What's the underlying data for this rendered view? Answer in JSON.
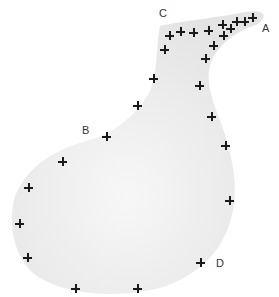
{
  "diagram": {
    "shape_fill": "#ededed",
    "labels": [
      {
        "id": "A",
        "text": "A",
        "x": 262,
        "y": 23
      },
      {
        "id": "B",
        "text": "B",
        "x": 82,
        "y": 125
      },
      {
        "id": "C",
        "text": "C",
        "x": 159,
        "y": 8
      },
      {
        "id": "D",
        "text": "D",
        "x": 216,
        "y": 258
      }
    ],
    "markers": [
      {
        "x": 169,
        "y": 35
      },
      {
        "x": 180,
        "y": 31
      },
      {
        "x": 193,
        "y": 32
      },
      {
        "x": 208,
        "y": 30
      },
      {
        "x": 222,
        "y": 24
      },
      {
        "x": 230,
        "y": 28
      },
      {
        "x": 236,
        "y": 21
      },
      {
        "x": 244,
        "y": 21
      },
      {
        "x": 252,
        "y": 17
      },
      {
        "x": 223,
        "y": 35
      },
      {
        "x": 213,
        "y": 45
      },
      {
        "x": 205,
        "y": 58
      },
      {
        "x": 164,
        "y": 49
      },
      {
        "x": 153,
        "y": 78
      },
      {
        "x": 199,
        "y": 85
      },
      {
        "x": 137,
        "y": 105
      },
      {
        "x": 106,
        "y": 136
      },
      {
        "x": 62,
        "y": 161
      },
      {
        "x": 28,
        "y": 187
      },
      {
        "x": 211,
        "y": 116
      },
      {
        "x": 225,
        "y": 145
      },
      {
        "x": 229,
        "y": 200
      },
      {
        "x": 19,
        "y": 223
      },
      {
        "x": 27,
        "y": 257
      },
      {
        "x": 75,
        "y": 288
      },
      {
        "x": 137,
        "y": 288
      },
      {
        "x": 200,
        "y": 262
      }
    ]
  }
}
